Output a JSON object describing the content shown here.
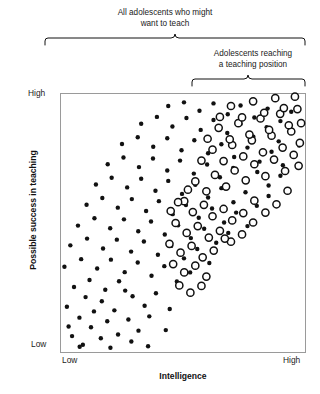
{
  "figure": {
    "title_top": "All adolescents who might\nwant to teach",
    "title_sub": "Adolescents reaching\na teaching position",
    "caption": ""
  },
  "axes": {
    "ylabel": "Possible success in teaching",
    "xlabel": "Intelligence",
    "y_high": "High",
    "y_low": "Low",
    "x_low": "Low",
    "x_high": "High"
  },
  "brackets": [
    {
      "name": "all-adolescents",
      "x0": 45,
      "x1": 305,
      "y": 45
    },
    {
      "name": "reaching-teaching-position",
      "x0": 192,
      "x1": 305,
      "y": 86
    }
  ],
  "chart_data": {
    "type": "scatter",
    "title": "All adolescents who might want to teach",
    "xlabel": "Intelligence",
    "ylabel": "Possible success in teaching",
    "xlim": [
      0,
      100
    ],
    "ylim": [
      0,
      100
    ],
    "xticks": [
      {
        "value": 0,
        "label": "Low"
      },
      {
        "value": 100,
        "label": "High"
      }
    ],
    "yticks": [
      {
        "value": 0,
        "label": "Low"
      },
      {
        "value": 100,
        "label": "High"
      }
    ],
    "grid": false,
    "legend": "none",
    "plot_frame": {
      "left": 60,
      "top": 93,
      "right": 306,
      "bottom": 353
    },
    "marker_styles": {
      "filled": {
        "name": "filled-dot",
        "radius_px": 2.2,
        "fill": "#111111",
        "stroke": "none"
      },
      "open": {
        "name": "open-circle",
        "radius_px": 3.6,
        "fill": "#ffffff",
        "stroke": "#111111",
        "stroke_width_px": 1.5
      }
    },
    "annotation": "Filled dots = all adolescents who might want to teach; open circles = adolescents reaching a teaching position (upper-right region of positive correlation band).",
    "series": [
      {
        "name": "All adolescents who might want to teach",
        "marker": "filled",
        "points": [
          [
            4.9,
            6.5
          ],
          [
            9.3,
            3.2
          ],
          [
            12.6,
            9.9
          ],
          [
            16.6,
            5.7
          ],
          [
            7.9,
            13.6
          ],
          [
            13.8,
            16.0
          ],
          [
            19.2,
            12.2
          ],
          [
            23.6,
            7.1
          ],
          [
            2.8,
            17.8
          ],
          [
            10.4,
            21.5
          ],
          [
            17.0,
            19.9
          ],
          [
            22.1,
            16.4
          ],
          [
            27.8,
            12.9
          ],
          [
            31.9,
            8.6
          ],
          [
            36.3,
            14.1
          ],
          [
            5.7,
            25.4
          ],
          [
            12.0,
            28.1
          ],
          [
            18.4,
            24.3
          ],
          [
            24.0,
            27.6
          ],
          [
            29.5,
            21.8
          ],
          [
            34.4,
            18.2
          ],
          [
            39.0,
            23.0
          ],
          [
            44.6,
            16.9
          ],
          [
            1.8,
            33.2
          ],
          [
            8.6,
            36.1
          ],
          [
            15.1,
            32.5
          ],
          [
            20.7,
            35.9
          ],
          [
            26.3,
            31.1
          ],
          [
            31.6,
            34.8
          ],
          [
            37.2,
            29.7
          ],
          [
            42.4,
            33.4
          ],
          [
            47.5,
            27.5
          ],
          [
            52.9,
            31.0
          ],
          [
            4.2,
            41.4
          ],
          [
            11.0,
            44.0
          ],
          [
            17.5,
            40.2
          ],
          [
            23.1,
            43.6
          ],
          [
            28.9,
            39.0
          ],
          [
            34.1,
            42.9
          ],
          [
            39.8,
            37.8
          ],
          [
            45.2,
            41.2
          ],
          [
            50.4,
            36.4
          ],
          [
            55.8,
            40.0
          ],
          [
            60.7,
            34.6
          ],
          [
            7.3,
            49.0
          ],
          [
            14.0,
            51.8
          ],
          [
            20.4,
            48.0
          ],
          [
            26.0,
            51.4
          ],
          [
            31.8,
            46.8
          ],
          [
            37.0,
            50.6
          ],
          [
            42.6,
            45.6
          ],
          [
            48.0,
            49.1
          ],
          [
            53.2,
            44.2
          ],
          [
            58.6,
            47.8
          ],
          [
            63.5,
            42.4
          ],
          [
            68.4,
            46.2
          ],
          [
            10.8,
            57.0
          ],
          [
            17.2,
            59.6
          ],
          [
            23.5,
            55.9
          ],
          [
            29.2,
            59.2
          ],
          [
            35.0,
            54.6
          ],
          [
            40.2,
            58.4
          ],
          [
            45.8,
            53.4
          ],
          [
            51.2,
            56.9
          ],
          [
            56.4,
            52.0
          ],
          [
            61.8,
            55.6
          ],
          [
            66.7,
            50.2
          ],
          [
            71.6,
            54.0
          ],
          [
            76.2,
            48.8
          ],
          [
            14.6,
            64.8
          ],
          [
            21.0,
            67.4
          ],
          [
            27.3,
            63.7
          ],
          [
            33.0,
            67.0
          ],
          [
            38.8,
            62.4
          ],
          [
            44.0,
            66.2
          ],
          [
            49.6,
            61.2
          ],
          [
            55.0,
            64.7
          ],
          [
            60.2,
            59.8
          ],
          [
            65.6,
            63.4
          ],
          [
            70.5,
            58.0
          ],
          [
            75.4,
            61.8
          ],
          [
            80.0,
            56.6
          ],
          [
            84.8,
            60.4
          ],
          [
            19.4,
            72.6
          ],
          [
            25.8,
            75.2
          ],
          [
            32.1,
            71.5
          ],
          [
            37.8,
            74.8
          ],
          [
            43.6,
            70.2
          ],
          [
            48.8,
            74.0
          ],
          [
            54.4,
            69.0
          ],
          [
            59.8,
            72.5
          ],
          [
            65.0,
            67.6
          ],
          [
            70.4,
            71.2
          ],
          [
            75.3,
            65.8
          ],
          [
            80.2,
            69.6
          ],
          [
            84.8,
            64.4
          ],
          [
            89.6,
            68.2
          ],
          [
            25.2,
            80.4
          ],
          [
            31.6,
            83.0
          ],
          [
            37.9,
            79.3
          ],
          [
            43.6,
            82.6
          ],
          [
            49.4,
            78.0
          ],
          [
            54.6,
            81.8
          ],
          [
            60.2,
            76.8
          ],
          [
            65.6,
            80.3
          ],
          [
            70.8,
            75.4
          ],
          [
            76.2,
            79.0
          ],
          [
            81.1,
            73.6
          ],
          [
            86.0,
            77.4
          ],
          [
            90.6,
            72.2
          ],
          [
            94.8,
            76.0
          ],
          [
            33.0,
            88.2
          ],
          [
            39.4,
            90.8
          ],
          [
            45.7,
            87.1
          ],
          [
            51.4,
            90.4
          ],
          [
            57.2,
            85.8
          ],
          [
            62.4,
            89.6
          ],
          [
            68.0,
            84.6
          ],
          [
            73.4,
            88.1
          ],
          [
            78.6,
            83.2
          ],
          [
            84.0,
            86.8
          ],
          [
            88.9,
            81.4
          ],
          [
            93.8,
            85.2
          ],
          [
            97.2,
            79.8
          ],
          [
            44.0,
            95.0
          ],
          [
            50.4,
            96.4
          ],
          [
            56.7,
            93.2
          ],
          [
            62.4,
            96.0
          ],
          [
            68.2,
            91.8
          ],
          [
            73.4,
            95.2
          ],
          [
            79.0,
            90.6
          ],
          [
            84.4,
            94.0
          ],
          [
            89.6,
            89.2
          ],
          [
            94.0,
            92.8
          ],
          [
            8.0,
            2.4
          ],
          [
            20.5,
            2.0
          ],
          [
            29.0,
            4.4
          ],
          [
            35.8,
            2.6
          ],
          [
            26.5,
            24.0
          ],
          [
            43.0,
            8.8
          ],
          [
            3.5,
            10.2
          ]
        ]
      },
      {
        "name": "Adolescents reaching a teaching position",
        "marker": "open",
        "points": [
          [
            55.0,
            66.0
          ],
          [
            59.5,
            62.2
          ],
          [
            63.0,
            68.5
          ],
          [
            67.5,
            64.0
          ],
          [
            71.0,
            70.2
          ],
          [
            75.5,
            66.4
          ],
          [
            79.0,
            72.6
          ],
          [
            83.5,
            68.0
          ],
          [
            87.0,
            74.4
          ],
          [
            91.5,
            70.0
          ],
          [
            95.0,
            76.2
          ],
          [
            57.5,
            74.0
          ],
          [
            62.0,
            78.2
          ],
          [
            66.5,
            73.8
          ],
          [
            70.0,
            80.0
          ],
          [
            74.5,
            75.6
          ],
          [
            78.0,
            81.8
          ],
          [
            82.5,
            77.2
          ],
          [
            86.0,
            83.6
          ],
          [
            90.5,
            79.0
          ],
          [
            94.0,
            85.2
          ],
          [
            97.5,
            80.8
          ],
          [
            60.0,
            82.4
          ],
          [
            64.5,
            86.6
          ],
          [
            69.0,
            82.2
          ],
          [
            72.5,
            88.4
          ],
          [
            77.0,
            84.0
          ],
          [
            81.5,
            90.2
          ],
          [
            85.0,
            85.8
          ],
          [
            89.5,
            92.0
          ],
          [
            93.0,
            87.6
          ],
          [
            96.5,
            93.8
          ],
          [
            65.0,
            90.8
          ],
          [
            69.5,
            95.0
          ],
          [
            74.0,
            90.6
          ],
          [
            78.5,
            96.8
          ],
          [
            83.0,
            92.4
          ],
          [
            87.5,
            98.0
          ],
          [
            91.0,
            94.2
          ],
          [
            95.5,
            98.6
          ],
          [
            50.5,
            58.4
          ],
          [
            54.0,
            54.2
          ],
          [
            58.5,
            57.0
          ],
          [
            62.0,
            52.6
          ],
          [
            66.5,
            55.4
          ],
          [
            70.0,
            51.0
          ],
          [
            74.5,
            53.8
          ],
          [
            79.0,
            58.6
          ],
          [
            83.5,
            54.0
          ],
          [
            88.0,
            57.2
          ],
          [
            92.5,
            62.4
          ],
          [
            47.0,
            50.0
          ],
          [
            51.5,
            46.2
          ],
          [
            56.0,
            48.8
          ],
          [
            60.5,
            44.4
          ],
          [
            65.0,
            47.0
          ],
          [
            69.5,
            42.8
          ],
          [
            74.0,
            45.6
          ],
          [
            78.5,
            50.2
          ],
          [
            44.5,
            42.0
          ],
          [
            49.0,
            38.6
          ],
          [
            53.5,
            41.2
          ],
          [
            58.0,
            36.8
          ],
          [
            62.5,
            39.4
          ],
          [
            67.0,
            44.0
          ],
          [
            46.0,
            34.2
          ],
          [
            50.5,
            31.0
          ],
          [
            55.0,
            33.6
          ],
          [
            59.5,
            29.4
          ],
          [
            48.5,
            26.0
          ],
          [
            53.0,
            23.2
          ],
          [
            57.5,
            25.8
          ],
          [
            98.0,
            88.4
          ],
          [
            97.0,
            72.0
          ],
          [
            52.0,
            62.8
          ],
          [
            48.0,
            58.0
          ],
          [
            45.0,
            54.6
          ]
        ]
      }
    ]
  }
}
